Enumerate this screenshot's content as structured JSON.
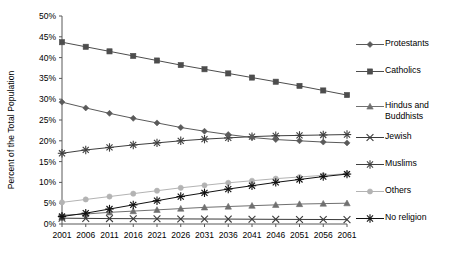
{
  "chart_data": {
    "type": "line",
    "title": "",
    "xlabel": "",
    "ylabel": "Percent of the Total Population",
    "x": [
      2001,
      2006,
      2011,
      2016,
      2021,
      2026,
      2031,
      2036,
      2041,
      2046,
      2051,
      2056,
      2061
    ],
    "xtick_labels": [
      "2001",
      "2006",
      "2011",
      "2016",
      "2021",
      "2026",
      "2031",
      "2036",
      "2041",
      "2046",
      "2051",
      "2056",
      "2061"
    ],
    "ytick_labels": [
      "0%",
      "5%",
      "10%",
      "15%",
      "20%",
      "25%",
      "30%",
      "35%",
      "40%",
      "45%",
      "50%"
    ],
    "ytick_values": [
      0,
      5,
      10,
      15,
      20,
      25,
      30,
      35,
      40,
      45,
      50
    ],
    "ylim": [
      0,
      50
    ],
    "xlim": [
      2001,
      2061
    ],
    "grid": false,
    "legend_position": "right",
    "series": [
      {
        "name": "Protestants",
        "marker": "diamond",
        "color": "#5a5a5a",
        "values": [
          29.3,
          27.9,
          26.6,
          25.4,
          24.3,
          23.2,
          22.3,
          21.5,
          20.8,
          20.3,
          20.0,
          19.7,
          19.5
        ]
      },
      {
        "name": "Catholics",
        "marker": "square",
        "color": "#4d4d4d",
        "values": [
          43.7,
          42.6,
          41.5,
          40.4,
          39.3,
          38.2,
          37.2,
          36.2,
          35.2,
          34.2,
          33.2,
          32.1,
          31.0
        ]
      },
      {
        "name": "Hindus and\nBuddhists",
        "marker": "triangle",
        "color": "#707070",
        "values": [
          2.1,
          2.4,
          2.8,
          3.1,
          3.4,
          3.7,
          4.0,
          4.2,
          4.4,
          4.6,
          4.8,
          4.9,
          5.0
        ]
      },
      {
        "name": "Jewish",
        "marker": "x",
        "color": "#3a3a3a",
        "values": [
          1.4,
          1.35,
          1.3,
          1.28,
          1.25,
          1.22,
          1.2,
          1.18,
          1.15,
          1.12,
          1.1,
          1.08,
          1.05
        ]
      },
      {
        "name": "Muslims",
        "marker": "star",
        "color": "#3f3f3f",
        "values": [
          17.0,
          17.8,
          18.4,
          19.0,
          19.5,
          20.0,
          20.4,
          20.7,
          21.0,
          21.2,
          21.3,
          21.4,
          21.5
        ]
      },
      {
        "name": "Others",
        "marker": "circle",
        "color": "#b3b3b3",
        "values": [
          5.2,
          5.9,
          6.6,
          7.3,
          8.0,
          8.7,
          9.3,
          9.9,
          10.4,
          10.9,
          11.3,
          11.7,
          12.1
        ]
      },
      {
        "name": "No religion",
        "marker": "star",
        "color": "#111111",
        "values": [
          1.8,
          2.6,
          3.6,
          4.6,
          5.6,
          6.6,
          7.5,
          8.4,
          9.2,
          10.0,
          10.7,
          11.4,
          12.0
        ]
      }
    ]
  },
  "legend": {
    "items": [
      {
        "label": "Protestants"
      },
      {
        "label": "Catholics"
      },
      {
        "label": "Hindus and\nBuddhists"
      },
      {
        "label": "Jewish"
      },
      {
        "label": "Muslims"
      },
      {
        "label": "Others"
      },
      {
        "label": "No religion"
      }
    ]
  }
}
